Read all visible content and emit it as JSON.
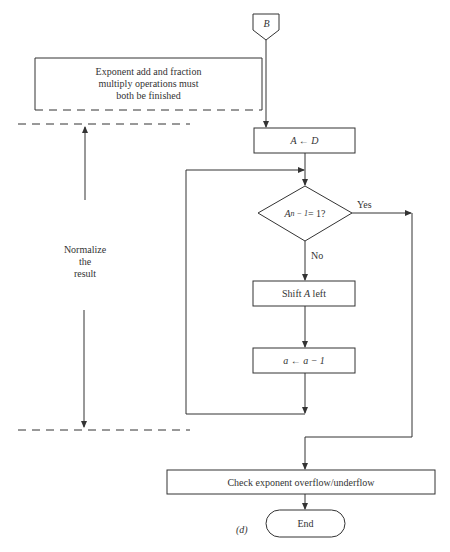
{
  "diagram": {
    "connector": {
      "label": "B",
      "shape": "off-page-connector"
    },
    "precondition": {
      "lines": [
        "Exponent add and fraction",
        "multiply operations must",
        "both be finished"
      ]
    },
    "steps": [
      {
        "id": "assign",
        "label": "A ← D",
        "shape": "process"
      },
      {
        "id": "decision",
        "label": "A",
        "subscript": "n − 1",
        "suffix": " = 1?",
        "shape": "decision",
        "yes_label": "Yes",
        "no_label": "No"
      },
      {
        "id": "shift",
        "label_pre": "Shift ",
        "label_var": "A",
        "label_post": " left",
        "shape": "process"
      },
      {
        "id": "decrement",
        "label": "a ← a − 1",
        "shape": "process"
      },
      {
        "id": "check",
        "label": "Check exponent overflow/underflow",
        "shape": "process"
      },
      {
        "id": "end",
        "label": "End",
        "shape": "terminal"
      }
    ],
    "phase_label": {
      "lines": [
        "Normalize",
        "the",
        "result"
      ]
    },
    "part_label": "(d)"
  },
  "colors": {
    "line": "#333333",
    "background": "#ffffff"
  }
}
